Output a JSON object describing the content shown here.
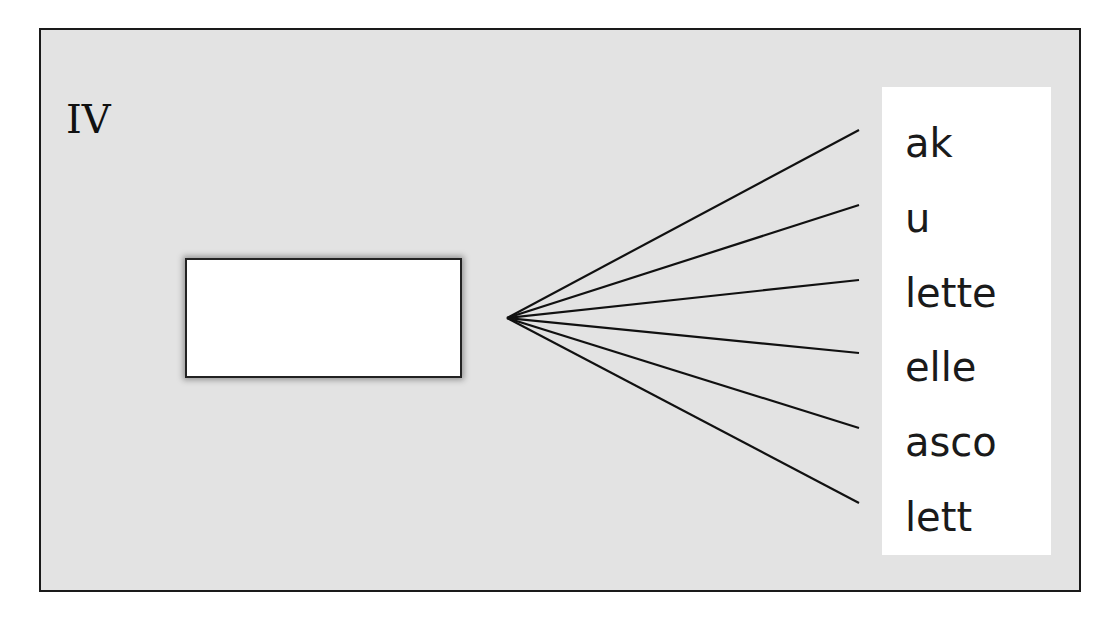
{
  "label": "IV",
  "blank_box": {
    "content": ""
  },
  "fan": {
    "origin": [
      507,
      318
    ],
    "endpoints": [
      [
        859,
        130
      ],
      [
        859,
        205
      ],
      [
        859,
        280
      ],
      [
        859,
        353
      ],
      [
        859,
        428
      ],
      [
        859,
        503
      ]
    ]
  },
  "suffixes": [
    {
      "text": "ak"
    },
    {
      "text": "u"
    },
    {
      "text": "lette"
    },
    {
      "text": "elle"
    },
    {
      "text": "asco"
    },
    {
      "text": "lett"
    }
  ],
  "colors": {
    "panel": "#e3e3e3",
    "border": "#1a1a1a",
    "text": "#1a1a1a"
  }
}
